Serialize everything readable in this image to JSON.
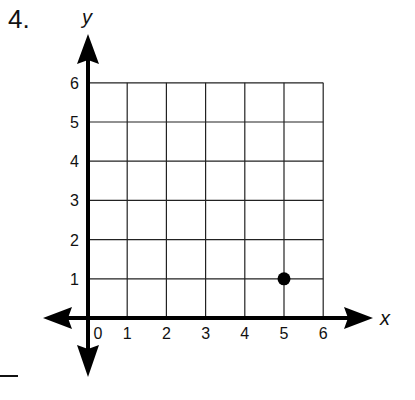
{
  "problem": {
    "number": "4."
  },
  "chart_data": {
    "type": "scatter",
    "title": "",
    "xlabel": "x",
    "ylabel": "y",
    "xlim": [
      0,
      6
    ],
    "ylim": [
      0,
      6
    ],
    "grid": true,
    "x_ticks": [
      "0",
      "1",
      "2",
      "3",
      "4",
      "5",
      "6"
    ],
    "y_ticks": [
      "1",
      "2",
      "3",
      "4",
      "5",
      "6"
    ],
    "points": [
      {
        "x": 5,
        "y": 1
      }
    ],
    "legend": []
  }
}
